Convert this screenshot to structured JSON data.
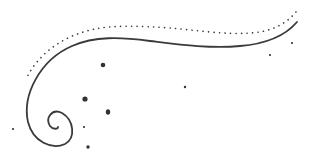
{
  "image": {
    "description": "Decorative swirl ornament with dotted arc and scattered dots",
    "width": 317,
    "height": 163,
    "background": "#ffffff",
    "stroke_color": "#3a3a3a",
    "dot_color": "#333333"
  },
  "ornament": {
    "main_curve": "M297 22 C 285 36, 265 44, 240 46 C 210 49, 175 44, 150 41 C 120 37, 95 36, 72 46 C 40 60, 22 95, 28 122 C 33 142, 52 150, 65 144 C 76 138, 74 120, 62 113 C 52 108, 45 118, 50 126 C 53 130, 58 129, 58 127",
    "dotted_arc": "M296 12 C 285 25, 270 32, 250 33 C 225 35, 195 30, 170 28 C 140 26, 115 25, 95 29 C 65 35, 40 52, 27 77",
    "dots": [
      {
        "cx": 103,
        "cy": 65,
        "r": 2.3
      },
      {
        "cx": 85,
        "cy": 99,
        "r": 2.6
      },
      {
        "cx": 108,
        "cy": 112,
        "rx": 2.2,
        "ry": 2.8
      },
      {
        "cx": 84,
        "cy": 127,
        "r": 1.1
      },
      {
        "cx": 88,
        "cy": 147,
        "r": 1.7
      },
      {
        "cx": 13,
        "cy": 129,
        "r": 1.1
      },
      {
        "cx": 185,
        "cy": 87,
        "r": 1.2
      },
      {
        "cx": 270,
        "cy": 55,
        "r": 1.1
      },
      {
        "cx": 292,
        "cy": 43,
        "r": 1.1
      }
    ]
  }
}
